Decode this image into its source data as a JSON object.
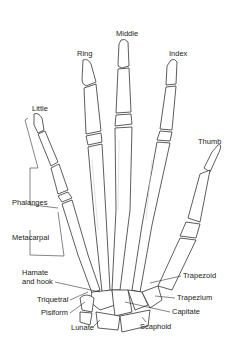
{
  "diagram": {
    "fingers": [
      {
        "name": "little",
        "label": "Little"
      },
      {
        "name": "ring",
        "label": "Ring"
      },
      {
        "name": "middle",
        "label": "Middle"
      },
      {
        "name": "index",
        "label": "Index"
      },
      {
        "name": "thumb",
        "label": "Thumb"
      }
    ],
    "groups": {
      "phalanges": "Phalanges",
      "metacarpal": "Metacarpal"
    },
    "carpals_left": {
      "hamate_line1": "Hamate",
      "hamate_line2": "and hook",
      "triquetral": "Triquetral",
      "pisiform": "Pisiform",
      "lunate": "Lunate"
    },
    "carpals_right": {
      "trapezoid": "Trapezoid",
      "trapezium": "Trapezium",
      "capitate": "Capitate",
      "scaphoid": "Scaphoid"
    },
    "colors": {
      "outline": "#333333",
      "shade": "#cfcfcf",
      "text": "#222222"
    }
  }
}
